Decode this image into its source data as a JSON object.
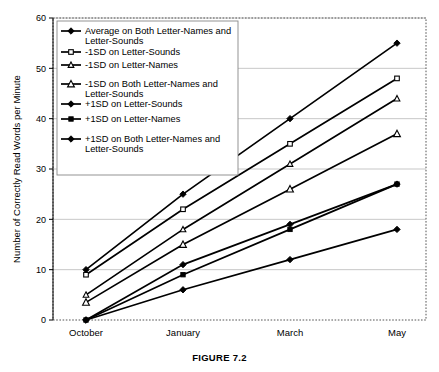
{
  "figure": {
    "caption": "FIGURE 7.2"
  },
  "chart_data": {
    "type": "line",
    "title": "",
    "xlabel": "",
    "ylabel": "Number of Correctly Read Words per Minute",
    "categories": [
      "October",
      "January",
      "March",
      "May"
    ],
    "ylim": [
      0,
      60
    ],
    "yticks": [
      0,
      10,
      20,
      30,
      40,
      50,
      60
    ],
    "ytick_labels": [
      "0",
      "10",
      "20",
      "30",
      "40",
      "50",
      "60"
    ],
    "grid": true,
    "grid_axis": "y",
    "legend_position": "upper-left-inside",
    "series": [
      {
        "name": "Average on Both Letter-Names and Letter-Sounds",
        "marker": "diamond-filled",
        "values": [
          10,
          25,
          40,
          55
        ]
      },
      {
        "name": "-1SD on Letter-Sounds",
        "marker": "square-open",
        "values": [
          9,
          22,
          35,
          48
        ]
      },
      {
        "name": "-1SD on Letter-Names",
        "marker": "triangle-open-small",
        "values": [
          5,
          18,
          31,
          44
        ]
      },
      {
        "name": "-1SD on Both Letter-Names and Letter-Sounds",
        "marker": "triangle-open",
        "values": [
          3.5,
          15,
          26,
          37
        ]
      },
      {
        "name": "+1SD on Letter-Sounds",
        "marker": "diamond-filled",
        "values": [
          0,
          11,
          19,
          27
        ]
      },
      {
        "name": "+1SD on Letter-Names",
        "marker": "square-filled",
        "values": [
          0,
          9,
          18,
          27
        ]
      },
      {
        "name": "+1SD on Both Letter-Names and Letter-Sounds",
        "marker": "diamond-filled",
        "values": [
          0,
          6,
          12,
          18
        ]
      }
    ]
  },
  "legend": {
    "entries": [
      {
        "label_line1": "Average on Both Letter-Names and",
        "label_line2": "Letter-Sounds",
        "marker": "diamond-filled"
      },
      {
        "label_line1": "-1SD on Letter-Sounds",
        "label_line2": "",
        "marker": "square-open"
      },
      {
        "label_line1": "-1SD on Letter-Names",
        "label_line2": "",
        "marker": "triangle-open-small"
      },
      {
        "label_line1": "-1SD on Both Letter-Names and",
        "label_line2": "Letter-Sounds",
        "marker": "triangle-open"
      },
      {
        "label_line1": "+1SD on Letter-Sounds",
        "label_line2": "",
        "marker": "diamond-filled"
      },
      {
        "label_line1": "+1SD on Letter-Names",
        "label_line2": "",
        "marker": "square-filled"
      },
      {
        "label_line1": "+1SD on Both Letter-Names and",
        "label_line2": "Letter-Sounds",
        "marker": "diamond-filled"
      }
    ]
  },
  "colors": {
    "ink": "#000000",
    "gridline": "#b9b9b9",
    "frame": "#555555",
    "legend_border": "#888888",
    "background": "#ffffff"
  }
}
